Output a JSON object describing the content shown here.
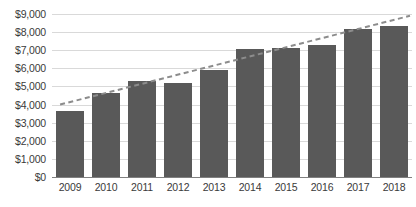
{
  "chart_data": {
    "type": "bar",
    "title": "",
    "subtitle": "",
    "xlabel": "",
    "ylabel": "",
    "categories": [
      "2009",
      "2010",
      "2011",
      "2012",
      "2013",
      "2014",
      "2015",
      "2016",
      "2017",
      "2018"
    ],
    "values": [
      3650,
      4650,
      5300,
      5200,
      5900,
      7050,
      7100,
      7300,
      8150,
      8350
    ],
    "ylim": [
      0,
      9000
    ],
    "ytick_values": [
      0,
      1000,
      2000,
      3000,
      4000,
      5000,
      6000,
      7000,
      8000,
      9000
    ],
    "ytick_labels": [
      "$0",
      "$1,000",
      "$2,000",
      "$3,000",
      "$4,000",
      "$5,000",
      "$6,000",
      "$7,000",
      "$8,000",
      "$9,000"
    ],
    "grid": true,
    "legend": false,
    "legend_position": "none",
    "bar_color": "#595959",
    "gridline_color": "#d9d9d9",
    "axis_color": "#808080",
    "text_color": "#3a3a3a",
    "series": [
      {
        "name": "Values",
        "type": "bar",
        "color": "#595959",
        "values": [
          3650,
          4650,
          5300,
          5200,
          5900,
          7050,
          7100,
          7300,
          8150,
          8350
        ]
      },
      {
        "name": "Trendline",
        "type": "line",
        "style": "dashed",
        "color": "#8c8c8c",
        "start_value": 4000,
        "end_value": 8900,
        "values": [
          4000,
          4545,
          5089,
          5633,
          6178,
          6722,
          7267,
          7811,
          8356,
          8900
        ]
      }
    ],
    "annotations": []
  }
}
